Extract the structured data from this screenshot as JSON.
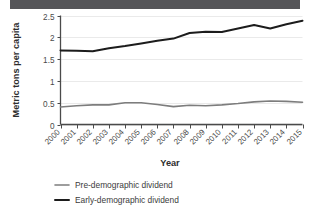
{
  "header": {
    "banner_color": "#555558"
  },
  "chart_data": {
    "type": "line",
    "title": "",
    "xlabel": "Year",
    "ylabel": "Metric tons per capita",
    "x": [
      2000,
      2001,
      2002,
      2003,
      2004,
      2005,
      2006,
      2007,
      2008,
      2009,
      2010,
      2011,
      2012,
      2013,
      2014,
      2015
    ],
    "categories": [
      "2000",
      "2001",
      "2002",
      "2003",
      "2004",
      "2005",
      "2006",
      "2007",
      "2008",
      "2009",
      "2010",
      "2011",
      "2012",
      "2013",
      "2014",
      "2015"
    ],
    "xlim": [
      2000,
      2015
    ],
    "ylim": [
      0,
      2.5
    ],
    "yticks": [
      0,
      0.5,
      1,
      1.5,
      2,
      2.5
    ],
    "ytick_labels": [
      "0",
      "0.5",
      "1",
      "1.5",
      "2",
      "2.5"
    ],
    "grid": true,
    "grid_axis": "y",
    "legend_position": "bottom",
    "series": [
      {
        "name": "Pre-demographic dividend",
        "color": "#7d7d7d",
        "width": 1.6,
        "values": [
          0.4,
          0.43,
          0.45,
          0.45,
          0.5,
          0.5,
          0.46,
          0.41,
          0.44,
          0.43,
          0.45,
          0.48,
          0.52,
          0.54,
          0.53,
          0.51
        ]
      },
      {
        "name": "Early-demographic dividend",
        "color": "#1c1c1c",
        "width": 2.0,
        "values": [
          1.7,
          1.69,
          1.68,
          1.75,
          1.8,
          1.86,
          1.92,
          1.97,
          2.1,
          2.13,
          2.12,
          2.2,
          2.28,
          2.2,
          2.3,
          2.38
        ]
      }
    ]
  },
  "axes": {
    "y_title": "Metric tons per capita",
    "x_title": "Year"
  },
  "legend": {
    "items": [
      {
        "label": "Pre-demographic dividend",
        "color": "#7d7d7d"
      },
      {
        "label": "Early-demographic dividend",
        "color": "#1c1c1c"
      }
    ]
  }
}
